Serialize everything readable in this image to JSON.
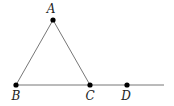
{
  "diagram": {
    "width": 174,
    "height": 106,
    "colors": {
      "line": "#777777",
      "point": "#000000",
      "label": "#222222"
    },
    "points": [
      {
        "id": "A",
        "label": "A",
        "x": 53,
        "y": 20,
        "lx": 51,
        "ly": 14
      },
      {
        "id": "B",
        "label": "B",
        "x": 16,
        "y": 85,
        "lx": 16,
        "ly": 99
      },
      {
        "id": "C",
        "label": "C",
        "x": 90,
        "y": 85,
        "lx": 90,
        "ly": 99
      },
      {
        "id": "D",
        "label": "D",
        "x": 127,
        "y": 85,
        "lx": 126,
        "ly": 99
      }
    ],
    "segments": [
      {
        "from": "A",
        "to": "B"
      },
      {
        "from": "A",
        "to": "C"
      }
    ],
    "ray": {
      "from": "B",
      "x2": 164,
      "y2": 85
    }
  }
}
